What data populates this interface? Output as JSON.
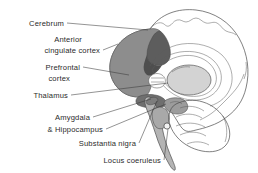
{
  "figure": {
    "background_color": "#ffffff",
    "text_color": "#2b2b2b",
    "leader_line_color": "#3a3a3a",
    "outline_color": "#4a4a4a"
  },
  "labels": [
    {
      "id": "cerebrum",
      "text": "Cerebrum",
      "x": 64,
      "y": 26,
      "anchor": "end"
    },
    {
      "id": "anterior",
      "text": "Anterior",
      "x": 82,
      "y": 42,
      "anchor": "end"
    },
    {
      "id": "cingulate-cortex",
      "text": "cingulate cortex",
      "x": 100,
      "y": 53,
      "anchor": "end"
    },
    {
      "id": "prefrontal",
      "text": "Prefrontal",
      "x": 80,
      "y": 70,
      "anchor": "end"
    },
    {
      "id": "cortex",
      "text": "cortex",
      "x": 70,
      "y": 81,
      "anchor": "end"
    },
    {
      "id": "thalamus",
      "text": "Thalamus",
      "x": 68,
      "y": 98,
      "anchor": "end"
    },
    {
      "id": "amygdala",
      "text": "Amygdala",
      "x": 90,
      "y": 120,
      "anchor": "end"
    },
    {
      "id": "hippocampus",
      "text": "& Hippocampus",
      "x": 103,
      "y": 132,
      "anchor": "end"
    },
    {
      "id": "substantia-nigra",
      "text": "Substantia nigra",
      "x": 136,
      "y": 146,
      "anchor": "end"
    },
    {
      "id": "locus-coeruleus",
      "text": "Locus coeruleus",
      "x": 161,
      "y": 163,
      "anchor": "end"
    }
  ],
  "structures": [
    {
      "id": "cerebrum",
      "name": "Cerebrum",
      "shade": "#d9d9d9"
    },
    {
      "id": "prefrontal",
      "name": "Prefrontal cortex",
      "shade": "#8a8a8a"
    },
    {
      "id": "anterior-cingulate",
      "name": "Anterior cingulate cortex",
      "shade": "#6a6a6a"
    },
    {
      "id": "thalamus",
      "name": "Thalamus",
      "shade": "#cfcfcf"
    },
    {
      "id": "amygdala",
      "name": "Amygdala",
      "shade": "#777777"
    },
    {
      "id": "hippocampus",
      "name": "Hippocampus",
      "shade": "#8d8d8d"
    },
    {
      "id": "substantia-nigra",
      "name": "Substantia nigra",
      "shade": "#9a9a9a"
    },
    {
      "id": "locus-coeruleus",
      "name": "Locus coeruleus",
      "shade": "#ffffff"
    },
    {
      "id": "cerebellum",
      "name": "Cerebellum",
      "shade": "#c6c6c6"
    },
    {
      "id": "brainstem",
      "name": "Brainstem",
      "shade": "#b2b2b2"
    }
  ]
}
